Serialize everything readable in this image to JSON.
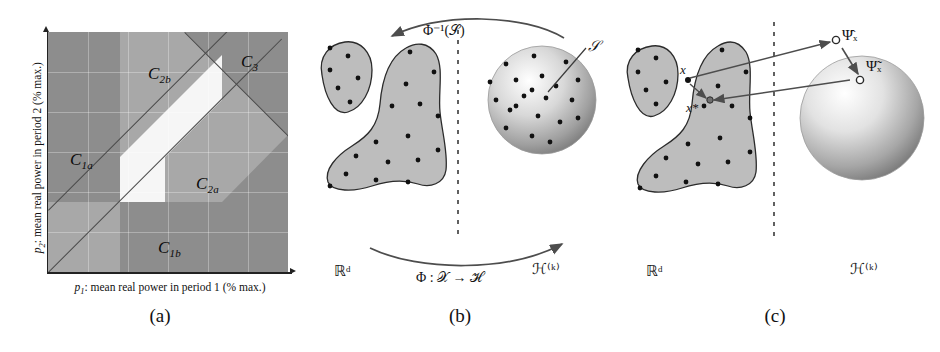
{
  "figure": {
    "kind": "three-panel scientific figure",
    "panels": [
      {
        "id": "a",
        "caption": "(a)"
      },
      {
        "id": "b",
        "caption": "(b)"
      },
      {
        "id": "c",
        "caption": "(c)"
      }
    ]
  },
  "panel_a": {
    "caption": "(a)",
    "x_axis_label": "p₁: mean real power in period 1 (% max.)",
    "x_axis_var": "p",
    "x_axis_sub": "1",
    "x_axis_rest": ": mean real power in period 1 (% max.)",
    "y_axis_label": "p₂: mean real power in period 2 (% max.)",
    "y_axis_var": "p",
    "y_axis_sub": "2",
    "y_axis_rest": ": mean real power in period 2 (% max.)",
    "regions": [
      {
        "name": "C1a",
        "label": "C",
        "sub": "1a",
        "shade": "#8d8d8d"
      },
      {
        "name": "C2b",
        "label": "C",
        "sub": "2b",
        "shade": "#a8a8a8"
      },
      {
        "name": "C3",
        "label": "C",
        "sub": "3",
        "shade": "#8d8d8d"
      },
      {
        "name": "C2a",
        "label": "C",
        "sub": "2a",
        "shade": "#a8a8a8"
      },
      {
        "name": "C1b",
        "label": "C",
        "sub": "1b",
        "shade": "#8d8d8d"
      }
    ],
    "colors": {
      "dark_gray": "#8d8d8d",
      "mid_gray": "#a8a8a8",
      "light_band": "#f4f4f4",
      "axis": "#222222",
      "diagonal_line": "#4a4a4a"
    }
  },
  "panel_b": {
    "caption": "(b)",
    "input_space_label": "ℝᵈ",
    "feature_space_label": "ℋ⁽ᵏ⁾",
    "top_arrow_label": "Φ⁻¹(𝒮)",
    "bottom_arrow_label": "Φ : 𝒳 → ℋ",
    "sphere_label": "𝒮",
    "divider": "dashed vertical line",
    "colors": {
      "blob_fill": "#b9b9b9",
      "blob_stroke": "#2b2b2b",
      "dot": "#111111",
      "sphere_light": "#ffffff",
      "sphere_dark": "#8f8f8f"
    }
  },
  "panel_c": {
    "caption": "(c)",
    "input_space_label": "ℝᵈ",
    "feature_space_label": "ℋ⁽ᵏ⁾",
    "point_label": "x",
    "preimage_label": "x*",
    "projected_label": "Ψ̂ₓ",
    "reconstructed_label": "Ψ̃ₓ",
    "divider": "dashed vertical line",
    "colors": {
      "blob_fill": "#b9b9b9",
      "blob_stroke": "#2b2b2b",
      "dot": "#111111",
      "arrow": "#4d4d4d",
      "open_marker_stroke": "#2b2b2b"
    }
  }
}
